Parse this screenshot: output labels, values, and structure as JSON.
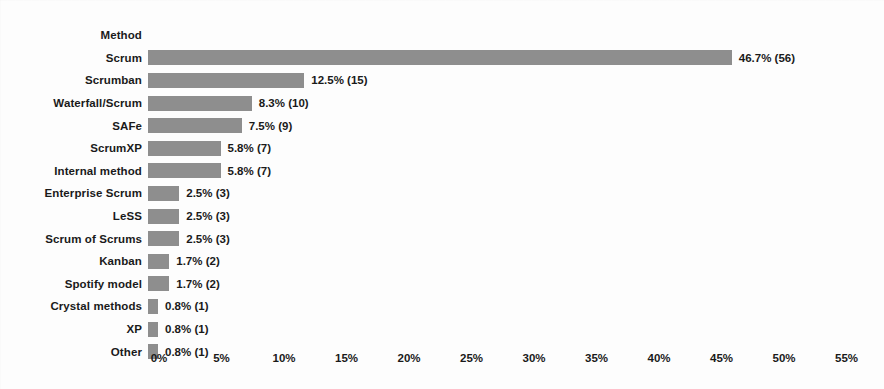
{
  "chart_data": {
    "type": "bar",
    "orientation": "horizontal",
    "title": "",
    "xlabel": "",
    "ylabel": "Method",
    "header_label": "Method",
    "grid": false,
    "legend": "none",
    "xlim": [
      0,
      57
    ],
    "xticks": [
      "0%",
      "5%",
      "10%",
      "15%",
      "20%",
      "25%",
      "30%",
      "35%",
      "40%",
      "45%",
      "50%",
      "55%"
    ],
    "xtick_values": [
      0,
      5,
      10,
      15,
      20,
      25,
      30,
      35,
      40,
      45,
      50,
      55
    ],
    "bar_color": "#8e8e8e",
    "text_color": "#1a1a1a",
    "background_color": "#fdfdfd",
    "categories": [
      "Scrum",
      "Scrumban",
      "Waterfall/Scrum",
      "SAFe",
      "ScrumXP",
      "Internal method",
      "Enterprise Scrum",
      "LeSS",
      "Scrum of Scrums",
      "Kanban",
      "Spotify model",
      "Crystal methods",
      "XP",
      "Other"
    ],
    "values": [
      46.7,
      12.5,
      8.3,
      7.5,
      5.8,
      5.8,
      2.5,
      2.5,
      2.5,
      1.7,
      1.7,
      0.8,
      0.8,
      0.8
    ],
    "counts": [
      56,
      15,
      10,
      9,
      7,
      7,
      3,
      3,
      3,
      2,
      2,
      1,
      1,
      1
    ],
    "data_labels": [
      "46.7% (56)",
      "12.5% (15)",
      "8.3% (10)",
      "7.5% (9)",
      "5.8% (7)",
      "5.8% (7)",
      "2.5% (3)",
      "2.5% (3)",
      "2.5% (3)",
      "1.7% (2)",
      "1.7% (2)",
      "0.8% (1)",
      "0.8% (1)",
      "0.8% (1)"
    ]
  }
}
